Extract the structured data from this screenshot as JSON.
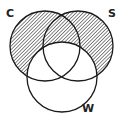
{
  "diagram": {
    "type": "venn",
    "sets": [
      {
        "label": "C",
        "cx": 45,
        "cy": 46,
        "r": 35
      },
      {
        "label": "S",
        "cx": 78,
        "cy": 46,
        "r": 35
      },
      {
        "label": "W",
        "cx": 62,
        "cy": 77,
        "r": 35
      }
    ],
    "shaded_regions": "C ∪ S minus W",
    "colors": {
      "stroke": "#1a1a1a",
      "hatch": "#333333",
      "background": "#ffffff"
    }
  }
}
